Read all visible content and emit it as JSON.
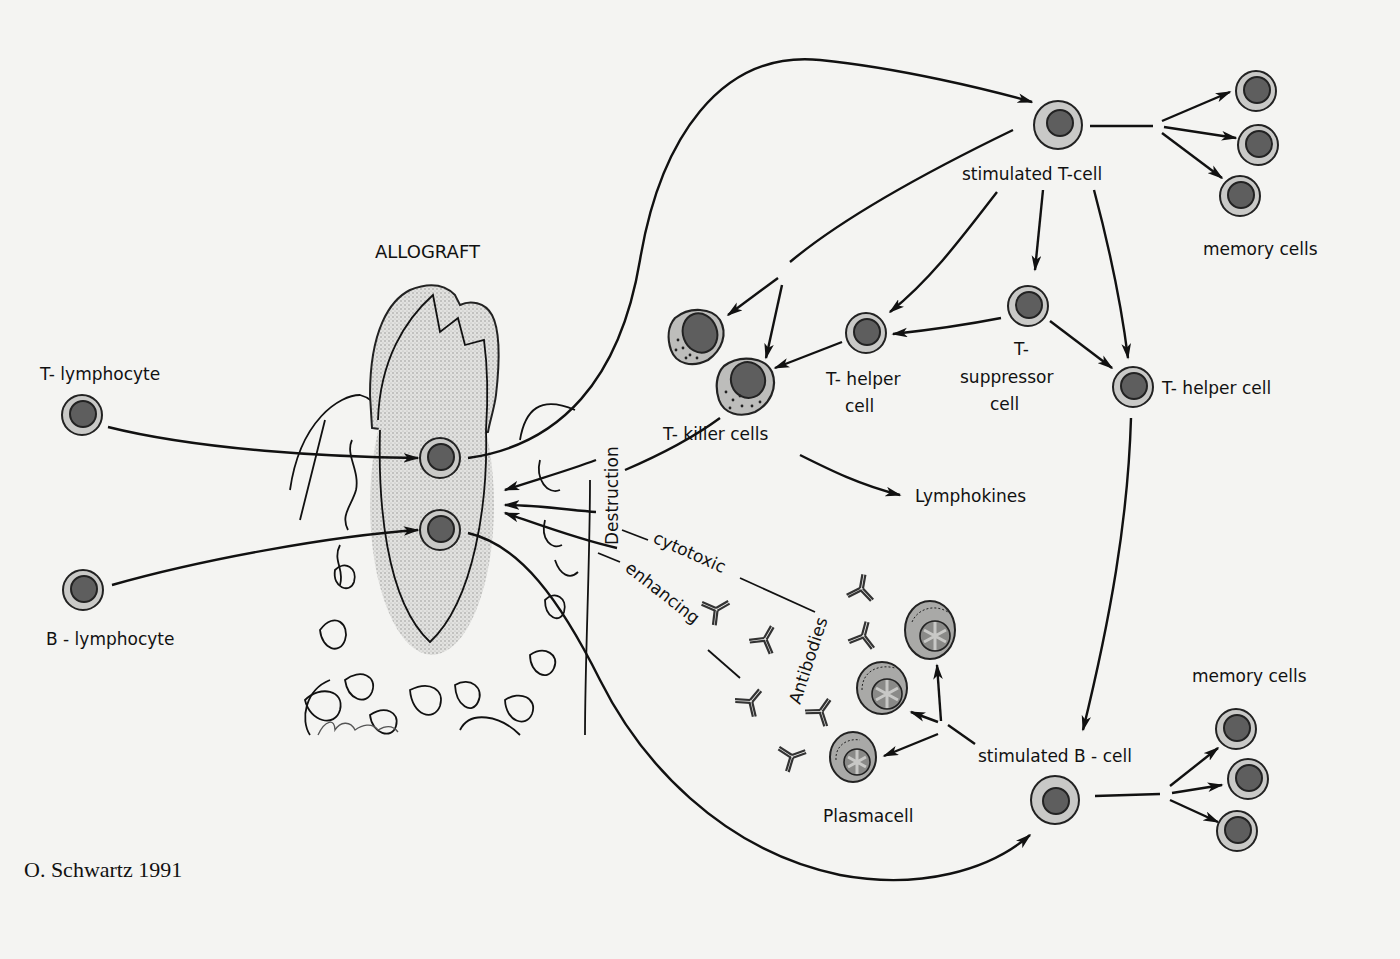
{
  "credit": "O. Schwartz 1991",
  "colors": {
    "background": "#f4f4f2",
    "ink": "#111111",
    "cell_outer": "#c9c9c7",
    "cell_nucleus": "#5e5e5e",
    "graft_stipple": "#d8d8d6"
  },
  "labels": {
    "allograft": "ALLOGRAFT",
    "t_lymphocyte": "T- lymphocyte",
    "b_lymphocyte": "B - lymphocyte",
    "stimulated_t_cell": "stimulated  T-cell",
    "memory_cells_top": "memory  cells",
    "t_helper_cell_mid_line1": "T- helper",
    "t_helper_cell_mid_line2": "cell",
    "t_suppressor_line1": "T-",
    "t_suppressor_line2": "suppressor",
    "t_suppressor_line3": "cell",
    "t_helper_cell_right": "T- helper  cell",
    "t_killer_cells": "T- killer  cells",
    "lymphokines": "Lymphokines",
    "destruction": "Destruction",
    "cytotoxic": "cytotoxic",
    "enhancing": "enhancing",
    "antibodies": "Antibodies",
    "stimulated_b_cell": "stimulated  B - cell",
    "memory_cells_bottom": "memory  cells",
    "plasmacell": "Plasmacell"
  },
  "nodes": [
    {
      "id": "t-lymphocyte",
      "label": "T- lymphocyte"
    },
    {
      "id": "b-lymphocyte",
      "label": "B - lymphocyte"
    },
    {
      "id": "allograft",
      "label": "ALLOGRAFT"
    },
    {
      "id": "stimulated-t-cell",
      "label": "stimulated T-cell"
    },
    {
      "id": "memory-cells-t",
      "label": "memory cells",
      "count": 3
    },
    {
      "id": "t-killer-cells",
      "label": "T- killer cells",
      "count": 2
    },
    {
      "id": "t-helper-cell-1",
      "label": "T- helper cell"
    },
    {
      "id": "t-suppressor-cell",
      "label": "T- suppressor cell"
    },
    {
      "id": "t-helper-cell-2",
      "label": "T- helper cell"
    },
    {
      "id": "lymphokines",
      "label": "Lymphokines"
    },
    {
      "id": "stimulated-b-cell",
      "label": "stimulated B - cell"
    },
    {
      "id": "plasmacells",
      "label": "Plasmacell",
      "count": 3
    },
    {
      "id": "antibodies",
      "label": "Antibodies"
    },
    {
      "id": "memory-cells-b",
      "label": "memory cells",
      "count": 3
    }
  ],
  "edges": [
    {
      "from": "t-lymphocyte",
      "to": "allograft"
    },
    {
      "from": "b-lymphocyte",
      "to": "allograft"
    },
    {
      "from": "allograft",
      "to": "stimulated-t-cell"
    },
    {
      "from": "allograft",
      "to": "stimulated-b-cell"
    },
    {
      "from": "stimulated-t-cell",
      "to": "memory-cells-t"
    },
    {
      "from": "stimulated-t-cell",
      "to": "t-killer-cells"
    },
    {
      "from": "stimulated-t-cell",
      "to": "t-helper-cell-1"
    },
    {
      "from": "stimulated-t-cell",
      "to": "t-suppressor-cell"
    },
    {
      "from": "stimulated-t-cell",
      "to": "t-helper-cell-2"
    },
    {
      "from": "t-suppressor-cell",
      "to": "t-helper-cell-1"
    },
    {
      "from": "t-suppressor-cell",
      "to": "t-helper-cell-2"
    },
    {
      "from": "t-helper-cell-1",
      "to": "t-killer-cells"
    },
    {
      "from": "t-killer-cells",
      "to": "lymphokines"
    },
    {
      "from": "t-killer-cells",
      "to": "allograft",
      "label": "Destruction"
    },
    {
      "from": "antibodies",
      "to": "allograft",
      "label": "cytotoxic"
    },
    {
      "from": "antibodies",
      "to": "allograft",
      "label": "enhancing"
    },
    {
      "from": "t-helper-cell-2",
      "to": "stimulated-b-cell"
    },
    {
      "from": "stimulated-b-cell",
      "to": "plasmacells"
    },
    {
      "from": "stimulated-b-cell",
      "to": "memory-cells-b"
    }
  ]
}
